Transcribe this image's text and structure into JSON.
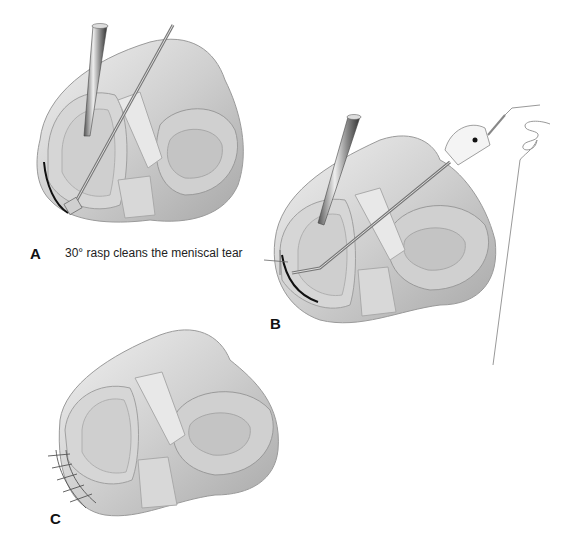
{
  "figure": {
    "panels": [
      {
        "id": "A",
        "label": "A",
        "caption": "30° rasp cleans the meniscal tear",
        "instruments": [
          "arthroscope",
          "rasp"
        ],
        "depicts": "meniscus-with-tear"
      },
      {
        "id": "B",
        "label": "B",
        "caption": "",
        "instruments": [
          "arthroscope",
          "suture-passer",
          "suture"
        ],
        "depicts": "meniscus-suture-passing"
      },
      {
        "id": "C",
        "label": "C",
        "caption": "",
        "instruments": [],
        "depicts": "meniscus-repaired-with-sutures"
      }
    ],
    "colors": {
      "background": "#ffffff",
      "tissue_light": "#e6e6e6",
      "tissue_mid": "#c8c8c8",
      "tissue_dark": "#9a9a9a",
      "instrument": "#7a7a7a",
      "tear_line": "#111111",
      "label_text": "#111111"
    }
  }
}
